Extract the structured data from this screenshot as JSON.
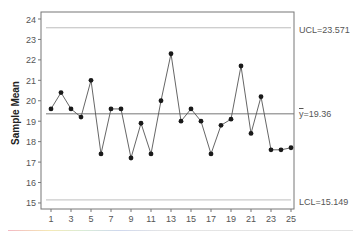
{
  "chart_data": {
    "type": "line",
    "title": "",
    "xlabel": "",
    "ylabel": "Sample Mean",
    "x": [
      1,
      2,
      3,
      4,
      5,
      6,
      7,
      8,
      9,
      10,
      11,
      12,
      13,
      14,
      15,
      16,
      17,
      18,
      19,
      20,
      21,
      22,
      23,
      24,
      25
    ],
    "series": [
      {
        "name": "Sample Mean",
        "values": [
          19.6,
          20.4,
          19.6,
          19.2,
          21.0,
          17.4,
          19.6,
          19.6,
          17.2,
          18.9,
          17.4,
          20.0,
          22.3,
          19.0,
          19.6,
          19.0,
          17.4,
          18.8,
          19.1,
          21.7,
          18.4,
          20.2,
          17.6,
          17.6,
          17.7
        ]
      }
    ],
    "control_limits": {
      "UCL": 23.571,
      "center": 19.36,
      "LCL": 15.149
    },
    "ylim": [
      14.8,
      24.2
    ],
    "xlim": [
      1,
      25
    ],
    "yticks": [
      15,
      16,
      17,
      18,
      19,
      20,
      21,
      22,
      23,
      24
    ],
    "xticks": [
      1,
      3,
      5,
      7,
      9,
      11,
      13,
      15,
      17,
      19,
      21,
      23,
      25
    ],
    "grid": false,
    "legend": "none"
  },
  "labels": {
    "ylabel": "Sample Mean",
    "ucl": "UCL=23.571",
    "center": "=19.36",
    "center_symbol": "y",
    "lcl": "LCL=15.149"
  },
  "colors": {
    "line": "#555555",
    "marker": "#1a1a1a",
    "limit_line": "#bdbdbd",
    "center_line": "#777777",
    "axis": "#777777"
  }
}
